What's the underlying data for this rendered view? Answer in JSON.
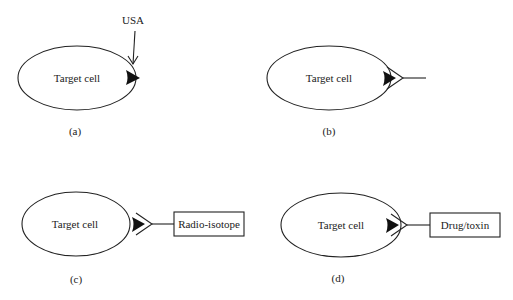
{
  "figure": {
    "panels": [
      {
        "id": "a",
        "caption": "(a)",
        "cell_label": "Target cell",
        "annotation": "USA",
        "attachment": "none"
      },
      {
        "id": "b",
        "caption": "(b)",
        "cell_label": "Target cell",
        "attachment": "antibody"
      },
      {
        "id": "c",
        "caption": "(c)",
        "cell_label": "Target cell",
        "attachment": "antibody",
        "payload_label": "Radio-isotope"
      },
      {
        "id": "d",
        "caption": "(d)",
        "cell_label": "Target cell",
        "attachment": "antibody",
        "payload_label": "Drug/toxin"
      }
    ],
    "colors": {
      "stroke": "#222222",
      "fill": "#ffffff",
      "antigen": "#111111"
    }
  }
}
